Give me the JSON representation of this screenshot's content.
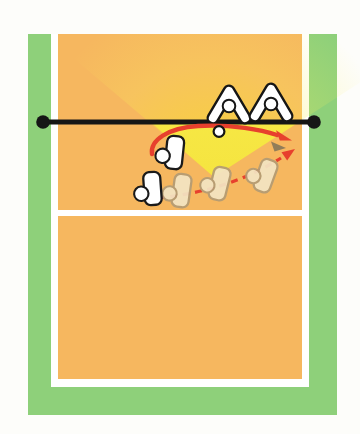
{
  "meta": {
    "type": "volleyball-tactics-diagram"
  },
  "colors": {
    "page-bg": "#fdfdfa",
    "surround-green": "#8ed07a",
    "court-orange": "#f6b75f",
    "line-white": "#ffffff",
    "cone-bright": "#f9f04c",
    "cone-deep": "#efd62e",
    "net-black": "#161616",
    "arrow-red": "#e7402d",
    "ghost-fill": "#f3e5c3",
    "ghost-stroke": "#b49c74"
  },
  "elements": {
    "court": {
      "surround": "green out-of-bounds apron",
      "floor": "orange playing court",
      "lines": [
        "left sideline",
        "right sideline",
        "end line",
        "attack line"
      ]
    },
    "net": {
      "label": "net",
      "posts": 2
    },
    "highlight_cone": {
      "label": "setting-zone highlight",
      "shape": "yellow light cone widening toward net"
    },
    "players": {
      "blockers": {
        "count": 2,
        "side": "opponent, above net"
      },
      "setter": {
        "count": 1
      },
      "attacker": {
        "count": 1
      },
      "attacker_ghosts": {
        "count": 3,
        "style": "faded previous positions"
      }
    },
    "arrows": {
      "set_trajectory": {
        "style": "solid red curve with ball and gray shadow at tip"
      },
      "approach_path": {
        "style": "dashed red curve with arrowhead"
      }
    },
    "ball": {
      "label": "volleyball",
      "style": "small white circle on set trajectory"
    }
  }
}
